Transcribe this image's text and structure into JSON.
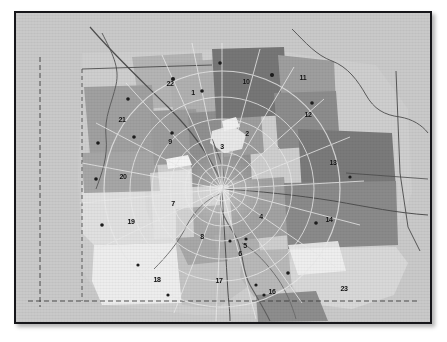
{
  "figure": {
    "kind": "scanned-grayscale-region-map",
    "background_color": "#c9c9c9",
    "frame_color": "#16161a",
    "page_color": "#ffffff",
    "palette": {
      "study_area_light": "#d7d7d7",
      "zone_very_light": "#ececec",
      "zone_light": "#d2d2d2",
      "zone_medium": "#b4b4b4",
      "zone_medium_dark": "#9a9a9a",
      "zone_dark": "#7e7e7e",
      "zone_darkest": "#6d6d6d",
      "zone_white": "#f2f2f2",
      "road_line": "#e2e2e2",
      "boundary_line": "#4a4a4a",
      "river_line": "#5a5a5a",
      "label_color": "#101010"
    }
  },
  "map": {
    "center_hub": {
      "x": 206,
      "y": 176
    },
    "ring_radii": [
      12,
      24,
      37,
      52,
      70,
      92,
      118
    ],
    "spoke_count": 24,
    "zones": [
      {
        "id": "2",
        "label": "2",
        "x": 231,
        "y": 120,
        "shade": "#9d9d9d"
      },
      {
        "id": "3",
        "label": "3",
        "x": 206,
        "y": 133,
        "shade": "#8f8f8f"
      },
      {
        "id": "4",
        "label": "4",
        "x": 245,
        "y": 203,
        "shade": "#a2a2a2"
      },
      {
        "id": "5",
        "label": "5",
        "x": 229,
        "y": 232,
        "shade": "#b0b0b0"
      },
      {
        "id": "6",
        "label": "6",
        "x": 224,
        "y": 240,
        "shade": "#b0b0b0"
      },
      {
        "id": "7",
        "label": "7",
        "x": 157,
        "y": 190,
        "shade": "#dcdcdc"
      },
      {
        "id": "8",
        "label": "8",
        "x": 186,
        "y": 223,
        "shade": "#a8a8a8"
      },
      {
        "id": "9",
        "label": "9",
        "x": 154,
        "y": 128,
        "shade": "#9c9c9c"
      },
      {
        "id": "10",
        "label": "10",
        "x": 230,
        "y": 68,
        "shade": "#767676"
      },
      {
        "id": "11",
        "label": "11",
        "x": 287,
        "y": 64,
        "shade": "#9e9e9e"
      },
      {
        "id": "12",
        "label": "12",
        "x": 292,
        "y": 101,
        "shade": "#8c8c8c"
      },
      {
        "id": "13",
        "label": "13",
        "x": 317,
        "y": 149,
        "shade": "#7a7a7a"
      },
      {
        "id": "14",
        "label": "14",
        "x": 313,
        "y": 206,
        "shade": "#8a8a8a"
      },
      {
        "id": "16",
        "label": "16",
        "x": 256,
        "y": 278,
        "shade": "#b8b8b8"
      },
      {
        "id": "17",
        "label": "17",
        "x": 203,
        "y": 267,
        "shade": "#c2c2c2"
      },
      {
        "id": "18",
        "label": "18",
        "x": 141,
        "y": 266,
        "shade": "#ededed"
      },
      {
        "id": "19",
        "label": "19",
        "x": 115,
        "y": 208,
        "shade": "#e0e0e0"
      },
      {
        "id": "20",
        "label": "20",
        "x": 107,
        "y": 163,
        "shade": "#a6a6a6"
      },
      {
        "id": "21",
        "label": "21",
        "x": 106,
        "y": 106,
        "shade": "#a0a0a0"
      },
      {
        "id": "22",
        "label": "22",
        "x": 154,
        "y": 70,
        "shade": "#b2b2b2"
      },
      {
        "id": "23",
        "label": "23",
        "x": 328,
        "y": 275,
        "shade": "#d8d8d8"
      },
      {
        "id": "24",
        "label": "24",
        "x": 284,
        "y": 316,
        "shade": "#8d8d8d"
      },
      {
        "id": "1",
        "label": "1",
        "x": 177,
        "y": 79,
        "shade": "#b2b2b2"
      }
    ]
  }
}
